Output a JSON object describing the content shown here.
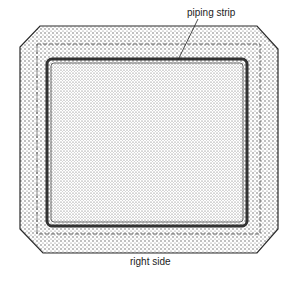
{
  "diagram": {
    "labels": {
      "piping_strip": "piping strip",
      "right_side": "right side"
    },
    "colors": {
      "fabric_fill": "#c8c8c8",
      "outline": "#2a2a2a",
      "background": "#ffffff"
    }
  }
}
